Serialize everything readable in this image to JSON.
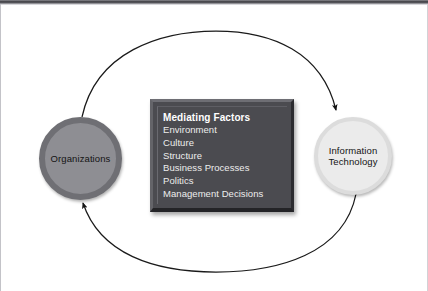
{
  "diagram": {
    "nodes": [
      {
        "id": "organizations",
        "label": "Organizations",
        "fill": "#8e8e93",
        "ring": "#6f6f74"
      },
      {
        "id": "information-technology",
        "label_line1": "Information",
        "label_line2": "Technology",
        "fill": "#ebebeb",
        "ring": "#dcdcdc"
      }
    ],
    "panel": {
      "title": "Mediating Factors",
      "background": "#4b4b50",
      "text_color": "#ededed",
      "items": [
        "Environment",
        "Culture",
        "Structure",
        "Business Processes",
        "Politics",
        "Management Decisions"
      ]
    },
    "loop": {
      "stroke": "#1a1a1a",
      "description": "Bidirectional elliptical loop connecting the two circles",
      "arrow_top_target": "information-technology",
      "arrow_bottom_target": "organizations"
    },
    "canvas_background": "#ffffff"
  }
}
